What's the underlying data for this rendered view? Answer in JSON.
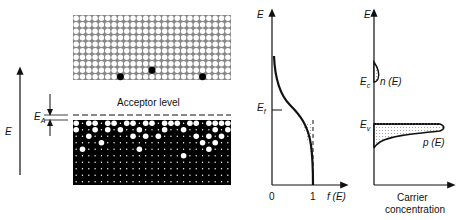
{
  "figure": {
    "left_axis": {
      "label": "E"
    },
    "lattice_top": {
      "cols": 25,
      "rows": 10,
      "filled_positions": [
        [
          7,
          9
        ],
        [
          12,
          8
        ],
        [
          20,
          9
        ]
      ]
    },
    "acceptor": {
      "label": "Acceptor level",
      "gap_label": "E",
      "gap_subscript": "A"
    },
    "lattice_bottom": {
      "cols": 25,
      "rows": 10
    },
    "fermi_plot": {
      "y_label": "E",
      "x_label": "f (E)",
      "tick_0": "0",
      "tick_1": "1",
      "fermi_label": "E",
      "fermi_subscript": "f"
    },
    "carrier_plot": {
      "y_label": "E",
      "ec_label": "E",
      "ec_subscript": "c",
      "n_label": "n (E)",
      "ev_label": "E",
      "ev_subscript": "v",
      "p_label": "p (E)",
      "x_label_line1": "Carrier",
      "x_label_line2": "concentration"
    }
  }
}
